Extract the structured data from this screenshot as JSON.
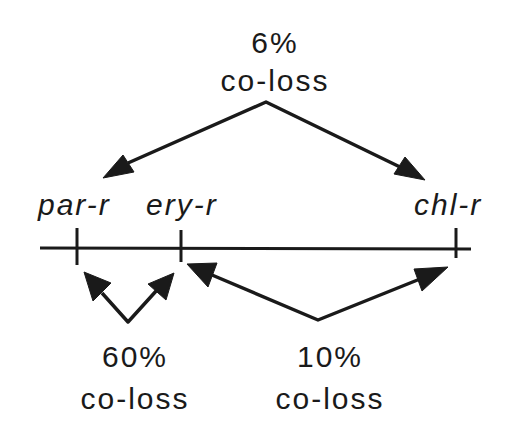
{
  "diagram": {
    "genes": [
      {
        "id": "par",
        "label": "par-r"
      },
      {
        "id": "ery",
        "label": "ery-r"
      },
      {
        "id": "chl",
        "label": "chl-r"
      }
    ],
    "relations": [
      {
        "between": [
          "par-r",
          "chl-r"
        ],
        "percent": "6%",
        "caption": "co-loss"
      },
      {
        "between": [
          "par-r",
          "ery-r"
        ],
        "percent": "60%",
        "caption": "co-loss"
      },
      {
        "between": [
          "ery-r",
          "chl-r"
        ],
        "percent": "10%",
        "caption": "co-loss"
      }
    ],
    "colors": {
      "ink": "#1a1a1a",
      "background": "#ffffff"
    }
  }
}
